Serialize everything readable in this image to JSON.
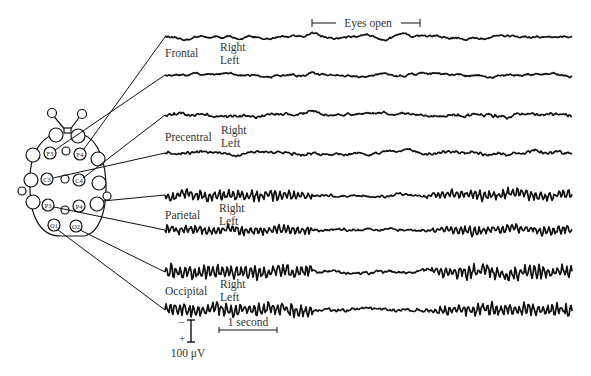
{
  "figure": {
    "annotation": "Eyes open",
    "scale": {
      "voltage_label": "100 μV",
      "minus": "−",
      "plus": "+",
      "time_label": "1 second"
    },
    "regions": [
      {
        "name": "Frontal",
        "right": "Right",
        "left": "Left"
      },
      {
        "name": "Precentral",
        "right": "Right",
        "left": "Left"
      },
      {
        "name": "Parietal",
        "right": "Right",
        "left": "Left"
      },
      {
        "name": "Occipital",
        "right": "Right",
        "left": "Left"
      }
    ],
    "electrodes": {
      "F3": "F3",
      "F4": "F4",
      "C3": "C3",
      "C4": "C4",
      "P3": "P3",
      "P4": "P4",
      "O1": "O1",
      "O2": "O2"
    },
    "traces": [
      {
        "region": "Frontal",
        "side": "Right",
        "y": 37,
        "amp": 2.2,
        "alpha": 0
      },
      {
        "region": "Frontal",
        "side": "Left",
        "y": 75,
        "amp": 2.2,
        "alpha": 0
      },
      {
        "region": "Precentral",
        "side": "Right",
        "y": 115,
        "amp": 2.4,
        "alpha": 0.5
      },
      {
        "region": "Precentral",
        "side": "Left",
        "y": 153,
        "amp": 2.4,
        "alpha": 0.5
      },
      {
        "region": "Parietal",
        "side": "Right",
        "y": 195,
        "amp": 2.2,
        "alpha": 3.5
      },
      {
        "region": "Parietal",
        "side": "Left",
        "y": 230,
        "amp": 2.2,
        "alpha": 3.0
      },
      {
        "region": "Occipital",
        "side": "Right",
        "y": 272,
        "amp": 2.2,
        "alpha": 4.5
      },
      {
        "region": "Occipital",
        "side": "Left",
        "y": 310,
        "amp": 2.2,
        "alpha": 4.5
      }
    ],
    "colors": {
      "ink": "#111111",
      "text": "#333333"
    }
  }
}
